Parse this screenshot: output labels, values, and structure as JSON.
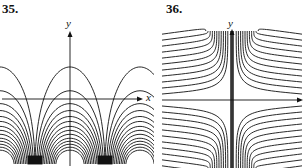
{
  "figures": [
    {
      "number": "35.",
      "x_label": "x",
      "y_label": "y",
      "description": "Family of arch-shaped level curves periodic in x, converging to cusps below the x-axis on either side of the y-axis"
    },
    {
      "number": "36.",
      "x_label": "x",
      "y_label": "y",
      "description": "Family of hyperbola-like level curves in all four quadrants, asymptotic to the y-axis and to horizontal lines"
    }
  ],
  "colors": {
    "ink": "#111111",
    "background": "#ffffff"
  }
}
